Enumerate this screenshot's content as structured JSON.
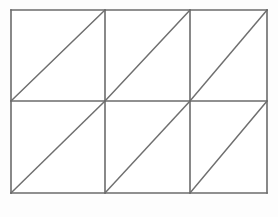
{
  "figure": {
    "background_color": "#fdfdfd",
    "line_color": "#6b6b6b",
    "diagonal_color": "#6f6f6f",
    "fill_color": "#ffffff",
    "stroke_width": 1.6,
    "diagonal_stroke_width": 1.5,
    "columns": 3,
    "rows": 2,
    "cell_count": 6,
    "triangle_count": 12,
    "bounds": {
      "left": 11,
      "top": 10,
      "right": 267,
      "bottom": 193,
      "width": 256,
      "height": 183
    },
    "vertical_dividers_x": [
      105,
      190
    ],
    "horizontal_dividers_y": [
      101
    ],
    "outline": {
      "top": {
        "x1": 11,
        "y1": 10,
        "x2": 267,
        "y2": 10
      },
      "right": {
        "x1": 267,
        "y1": 10,
        "x2": 267,
        "y2": 193
      },
      "bottom": {
        "x1": 11,
        "y1": 193,
        "x2": 267,
        "y2": 193
      },
      "left": {
        "x1": 11,
        "y1": 10,
        "x2": 11,
        "y2": 193
      }
    },
    "interior_lines": [
      {
        "name": "vertical-divider-1",
        "x1": 105,
        "y1": 10,
        "x2": 105,
        "y2": 193
      },
      {
        "name": "vertical-divider-2",
        "x1": 190,
        "y1": 10,
        "x2": 190,
        "y2": 193
      },
      {
        "name": "horizontal-divider-1",
        "x1": 11,
        "y1": 101,
        "x2": 267,
        "y2": 101
      }
    ],
    "cells": [
      {
        "name": "cell-r1c1",
        "row": 1,
        "col": 1,
        "x": 11,
        "y": 10,
        "w": 94,
        "h": 91,
        "diagonal": {
          "direction": "bottom-left-to-top-right",
          "x1": 11,
          "y1": 101,
          "x2": 105,
          "y2": 10
        }
      },
      {
        "name": "cell-r1c2",
        "row": 1,
        "col": 2,
        "x": 105,
        "y": 10,
        "w": 85,
        "h": 91,
        "diagonal": {
          "direction": "bottom-left-to-top-right",
          "x1": 105,
          "y1": 101,
          "x2": 190,
          "y2": 10
        }
      },
      {
        "name": "cell-r1c3",
        "row": 1,
        "col": 3,
        "x": 190,
        "y": 10,
        "w": 77,
        "h": 91,
        "diagonal": {
          "direction": "bottom-left-to-top-right",
          "x1": 190,
          "y1": 101,
          "x2": 267,
          "y2": 10
        }
      },
      {
        "name": "cell-r2c1",
        "row": 2,
        "col": 1,
        "x": 11,
        "y": 101,
        "w": 94,
        "h": 92,
        "diagonal": {
          "direction": "bottom-left-to-top-right",
          "x1": 11,
          "y1": 193,
          "x2": 105,
          "y2": 101
        }
      },
      {
        "name": "cell-r2c2",
        "row": 2,
        "col": 2,
        "x": 105,
        "y": 101,
        "w": 85,
        "h": 92,
        "diagonal": {
          "direction": "bottom-left-to-top-right",
          "x1": 105,
          "y1": 193,
          "x2": 190,
          "y2": 101
        }
      },
      {
        "name": "cell-r2c3",
        "row": 2,
        "col": 3,
        "x": 190,
        "y": 101,
        "w": 77,
        "h": 92,
        "diagonal": {
          "direction": "bottom-left-to-top-right",
          "x1": 190,
          "y1": 193,
          "x2": 267,
          "y2": 101
        }
      }
    ]
  }
}
